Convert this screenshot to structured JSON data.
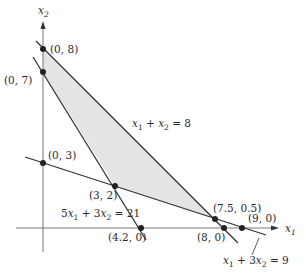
{
  "diagram": {
    "type": "linear-programming-feasible-region",
    "colors": {
      "background": "#ffffff",
      "region_fill": "#e4e4e6",
      "line": "#333333",
      "axis": "#777777",
      "point": "#222222",
      "text": "#2a2a2a"
    },
    "axes": {
      "x_label": "x",
      "x_label_sub": "1",
      "y_label": "x",
      "y_label_sub": "2"
    },
    "constraint_lines": [
      {
        "id": "line-x1-plus-x2-eq-8",
        "lhs_a": "x",
        "lhs_a_sub": "1",
        "op": " + ",
        "lhs_b": "x",
        "lhs_b_sub": "2",
        "rhs": " = 8",
        "equation": "x1 + x2 = 8"
      },
      {
        "id": "line-5x1-plus-3x2-eq-21",
        "coef_a": "5",
        "lhs_a": "x",
        "lhs_a_sub": "1",
        "op": " + 3",
        "lhs_b": "x",
        "lhs_b_sub": "2",
        "rhs": " = 21",
        "equation": "5x1 + 3x2 = 21"
      },
      {
        "id": "line-x1-plus-3x2-eq-9",
        "lhs_a": "x",
        "lhs_a_sub": "1",
        "op": " + 3",
        "lhs_b": "x",
        "lhs_b_sub": "2",
        "rhs": " = 9",
        "equation": "x1 + 3x2 = 9"
      }
    ],
    "points": [
      {
        "label": "(0, 8)",
        "x": 0,
        "y": 8
      },
      {
        "label": "(0, 7)",
        "x": 0,
        "y": 7
      },
      {
        "label": "(0, 3)",
        "x": 0,
        "y": 3
      },
      {
        "label": "(3, 2)",
        "x": 3,
        "y": 2
      },
      {
        "label": "(4.2, 0)",
        "x": 4.2,
        "y": 0
      },
      {
        "label": "(7.5, 0.5)",
        "x": 7.5,
        "y": 0.5
      },
      {
        "label": "(8, 0)",
        "x": 8,
        "y": 0
      },
      {
        "label": "(9, 0)",
        "x": 9,
        "y": 0
      }
    ],
    "feasible_region_vertices": [
      "(0, 8)",
      "(0, 7)",
      "(3, 2)",
      "(7.5, 0.5)"
    ]
  }
}
